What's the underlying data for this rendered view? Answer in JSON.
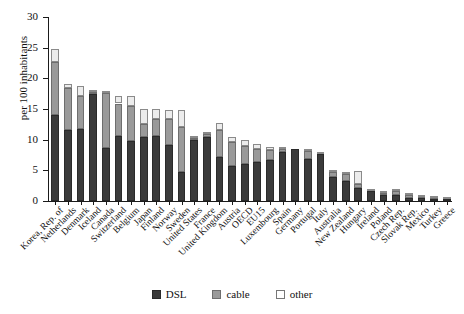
{
  "chart_data": {
    "type": "bar",
    "stacked": true,
    "title": "",
    "xlabel": "",
    "ylabel": "per 100 inhabitants",
    "ylim": [
      0,
      30
    ],
    "yticks": [
      0,
      5,
      10,
      15,
      20,
      25,
      30
    ],
    "grid": false,
    "legend_position": "bottom",
    "legend": [
      "DSL",
      "cable",
      "other"
    ],
    "series_colors": {
      "DSL": "#3b3b3b",
      "cable": "#9a9a9a",
      "other": "#ececec"
    },
    "categories": [
      "Korea, Rep. of",
      "Netherlands",
      "Denmark",
      "Iceland",
      "Canada",
      "Switzerland",
      "Belgium",
      "Japan",
      "Finland",
      "Norway",
      "Sweden",
      "United States",
      "France",
      "United Kingdom",
      "Austria",
      "OECD",
      "EU15",
      "Luxembourg",
      "Spain",
      "Germany",
      "Portugal",
      "Italy",
      "Australia",
      "New Zealand",
      "Hungary",
      "Ireland",
      "Poland",
      "Czech Rep.",
      "Slovak Rep.",
      "Mexico",
      "Turkey",
      "Greece"
    ],
    "series": [
      {
        "name": "DSL",
        "values": [
          14.0,
          11.6,
          11.8,
          17.5,
          8.6,
          10.6,
          9.8,
          10.5,
          10.6,
          9.2,
          4.7,
          9.9,
          10.4,
          7.2,
          5.7,
          6.0,
          6.3,
          6.7,
          8.0,
          8.5,
          6.9,
          7.7,
          3.9,
          3.3,
          2.2,
          1.6,
          0.9,
          0.9,
          0.5,
          0.5,
          0.4,
          0.4
        ]
      },
      {
        "name": "cable",
        "values": [
          8.6,
          6.8,
          5.3,
          0.3,
          9.0,
          5.3,
          5.7,
          2.1,
          2.7,
          4.2,
          7.3,
          0.4,
          0.6,
          4.4,
          4.0,
          3.0,
          2.2,
          1.6,
          0.4,
          0.0,
          1.2,
          0.0,
          0.8,
          1.1,
          0.6,
          0.0,
          0.4,
          0.7,
          0.4,
          0.2,
          0.1,
          0.0
        ]
      },
      {
        "name": "other",
        "values": [
          2.2,
          0.6,
          1.6,
          0.3,
          0.2,
          1.3,
          1.7,
          2.4,
          1.7,
          1.4,
          2.8,
          0.3,
          0.2,
          1.2,
          0.7,
          1.0,
          0.8,
          0.5,
          0.3,
          0.0,
          0.4,
          0.2,
          0.2,
          0.1,
          2.1,
          0.1,
          0.2,
          0.2,
          0.2,
          0.1,
          0.1,
          0.1
        ]
      }
    ],
    "totals": [
      24.8,
      19.0,
      18.7,
      18.1,
      17.8,
      17.2,
      17.2,
      15.0,
      15.0,
      14.8,
      14.8,
      10.6,
      11.2,
      12.8,
      10.4,
      10.0,
      9.3,
      8.8,
      8.7,
      8.5,
      8.5,
      7.9,
      4.9,
      4.5,
      4.9,
      1.7,
      1.5,
      1.8,
      1.1,
      0.8,
      0.6,
      0.5
    ]
  }
}
